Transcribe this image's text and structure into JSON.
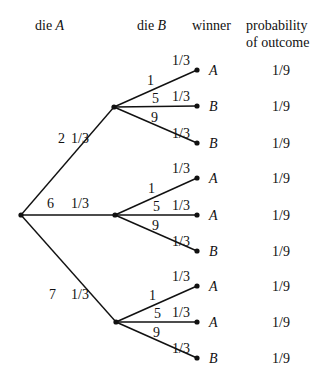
{
  "headers": {
    "die_a_prefix": "die ",
    "die_a_var": "A",
    "die_b_prefix": "die ",
    "die_b_var": "B",
    "winner": "winner",
    "probability_line1": "probability",
    "probability_line2": "of outcome"
  },
  "root": {
    "x": 21,
    "y": 215
  },
  "branches_a": [
    {
      "value": "2",
      "prob": "1/3",
      "node": {
        "x": 114,
        "y": 107
      },
      "label_x": 58,
      "label_y": 143,
      "prob_x": 71
    },
    {
      "value": "6",
      "prob": "1/3",
      "node": {
        "x": 115,
        "y": 215
      },
      "label_x": 47,
      "label_y": 208,
      "prob_x": 71
    },
    {
      "value": "7",
      "prob": "1/3",
      "node": {
        "x": 116,
        "y": 322
      },
      "label_x": 49,
      "label_y": 299,
      "prob_x": 71
    }
  ],
  "branches_b": [
    [
      {
        "value": "1",
        "prob": "1/3",
        "winner": "A",
        "outcome": "1/9",
        "leaf_y": 70
      },
      {
        "value": "5",
        "prob": "1/3",
        "winner": "B",
        "outcome": "1/9",
        "leaf_y": 106
      },
      {
        "value": "9",
        "prob": "1/3",
        "winner": "B",
        "outcome": "1/9",
        "leaf_y": 143
      }
    ],
    [
      {
        "value": "1",
        "prob": "1/3",
        "winner": "A",
        "outcome": "1/9",
        "leaf_y": 178
      },
      {
        "value": "5",
        "prob": "1/3",
        "winner": "A",
        "outcome": "1/9",
        "leaf_y": 215
      },
      {
        "value": "9",
        "prob": "1/3",
        "winner": "B",
        "outcome": "1/9",
        "leaf_y": 251
      }
    ],
    [
      {
        "value": "1",
        "prob": "1/3",
        "winner": "A",
        "outcome": "1/9",
        "leaf_y": 286
      },
      {
        "value": "5",
        "prob": "1/3",
        "winner": "A",
        "outcome": "1/9",
        "leaf_y": 322
      },
      {
        "value": "9",
        "prob": "1/3",
        "winner": "B",
        "outcome": "1/9",
        "leaf_y": 358
      }
    ]
  ],
  "leaf_x": 197,
  "colors": {
    "line": "#111111",
    "text": "#111111",
    "background": "#ffffff"
  }
}
